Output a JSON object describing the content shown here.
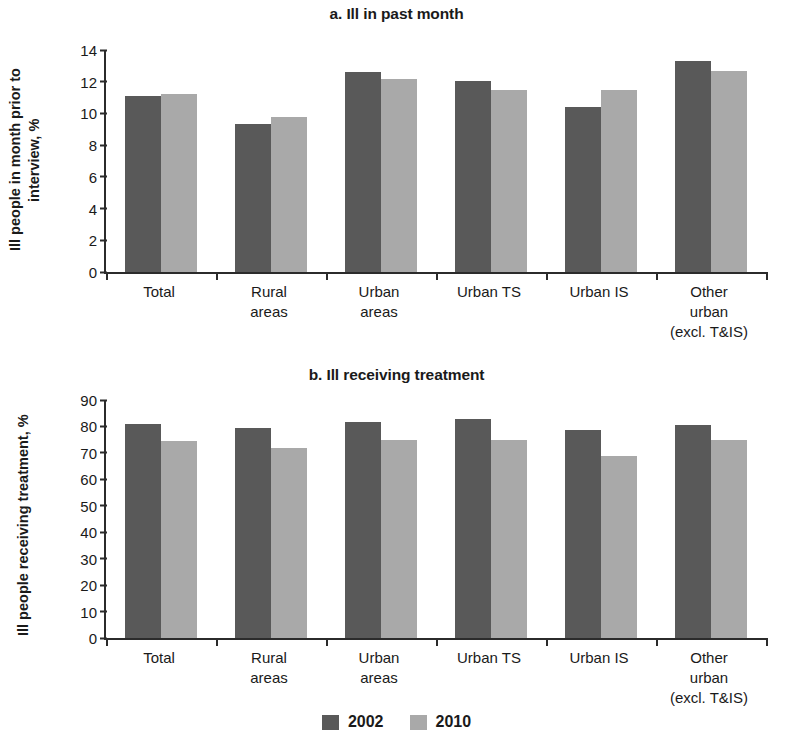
{
  "legend": {
    "series": [
      {
        "name": "2002",
        "color": "#595959"
      },
      {
        "name": "2010",
        "color": "#a9a9a9"
      }
    ]
  },
  "panels": {
    "a": {
      "title": "a. Ill in past month",
      "ylabel": "Ill people in month prior to\ninterview, %"
    },
    "b": {
      "title": "b. Ill receiving treatment",
      "ylabel": "Ill people receiving treatment, %"
    }
  },
  "chart_data": [
    {
      "type": "bar",
      "title": "a. Ill in past month",
      "xlabel": "",
      "ylabel": "Ill people in month prior to interview, %",
      "ylim": [
        0,
        14
      ],
      "yticks": [
        0,
        2,
        4,
        6,
        8,
        10,
        12,
        14
      ],
      "grid": false,
      "legend_position": "bottom-center",
      "categories": [
        "Total",
        "Rural\nareas",
        "Urban\nareas",
        "Urban TS",
        "Urban IS",
        "Other\nurban\n(excl. T&IS)"
      ],
      "series": [
        {
          "name": "2002",
          "color": "#595959",
          "values": [
            11.1,
            9.35,
            12.6,
            12.05,
            10.4,
            13.3
          ]
        },
        {
          "name": "2010",
          "color": "#a9a9a9",
          "values": [
            11.2,
            9.8,
            12.15,
            11.5,
            11.5,
            12.7
          ]
        }
      ]
    },
    {
      "type": "bar",
      "title": "b. Ill receiving treatment",
      "xlabel": "",
      "ylabel": "Ill people receiving treatment, %",
      "ylim": [
        0,
        90
      ],
      "yticks": [
        0,
        10,
        20,
        30,
        40,
        50,
        60,
        70,
        80,
        90
      ],
      "grid": false,
      "legend_position": "bottom-center",
      "categories": [
        "Total",
        "Rural\nareas",
        "Urban\nareas",
        "Urban TS",
        "Urban IS",
        "Other\nurban\n(excl. T&IS)"
      ],
      "series": [
        {
          "name": "2002",
          "color": "#595959",
          "values": [
            81,
            79.5,
            81.5,
            83,
            78.5,
            80.5
          ]
        },
        {
          "name": "2010",
          "color": "#a9a9a9",
          "values": [
            74.5,
            72,
            75,
            75,
            69,
            75
          ]
        }
      ]
    }
  ]
}
